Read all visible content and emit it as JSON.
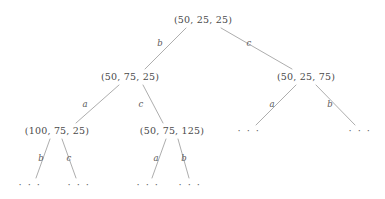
{
  "figure": {
    "kind": "derivation-tree",
    "stroke_color": "#8a8a8a",
    "text_color": "#4a4a4a",
    "background_color": "#ffffff",
    "ellipsis": "· · ·"
  },
  "nodes": {
    "root": {
      "label": "(50, 25, 25)",
      "x": 203,
      "y": 20
    },
    "left": {
      "label": "(50, 75, 25)",
      "x": 130,
      "y": 77
    },
    "right": {
      "label": "(50, 25, 75)",
      "x": 306,
      "y": 77
    },
    "left_left": {
      "label": "(100, 75, 25)",
      "x": 57,
      "y": 131
    },
    "left_right": {
      "label": "(50, 75, 125)",
      "x": 172,
      "y": 131
    },
    "right_left": {
      "label": "· · ·",
      "x": 249,
      "y": 131
    },
    "right_right": {
      "label": "· · ·",
      "x": 360,
      "y": 131
    },
    "ll_left": {
      "label": "· · ·",
      "x": 30,
      "y": 185
    },
    "ll_right": {
      "label": "· · ·",
      "x": 79,
      "y": 185
    },
    "lr_left": {
      "label": "· · ·",
      "x": 148,
      "y": 185
    },
    "lr_right": {
      "label": "· · ·",
      "x": 190,
      "y": 185
    }
  },
  "edges": [
    {
      "name": "root-to-left",
      "label": "b",
      "x1": 186,
      "y1": 28,
      "x2": 145,
      "y2": 69,
      "lx": 160,
      "ly": 43
    },
    {
      "name": "root-to-right",
      "label": "c",
      "x1": 221,
      "y1": 28,
      "x2": 292,
      "y2": 69,
      "lx": 249,
      "ly": 43
    },
    {
      "name": "left-to-left-left",
      "label": "a",
      "x1": 119,
      "y1": 85,
      "x2": 76,
      "y2": 123,
      "lx": 85,
      "ly": 104
    },
    {
      "name": "left-to-left-right",
      "label": "c",
      "x1": 143,
      "y1": 85,
      "x2": 163,
      "y2": 123,
      "lx": 141,
      "ly": 104
    },
    {
      "name": "right-to-right-left",
      "label": "a",
      "x1": 296,
      "y1": 85,
      "x2": 256,
      "y2": 125,
      "lx": 272,
      "ly": 104
    },
    {
      "name": "right-to-right-right",
      "label": "b",
      "x1": 316,
      "y1": 85,
      "x2": 355,
      "y2": 125,
      "lx": 330,
      "ly": 104
    },
    {
      "name": "ll-to-ll-left",
      "label": "b",
      "x1": 50,
      "y1": 139,
      "x2": 36,
      "y2": 178,
      "lx": 41,
      "ly": 158
    },
    {
      "name": "ll-to-ll-right",
      "label": "c",
      "x1": 62,
      "y1": 139,
      "x2": 76,
      "y2": 178,
      "lx": 69,
      "ly": 158
    },
    {
      "name": "lr-to-lr-left",
      "label": "a",
      "x1": 166,
      "y1": 139,
      "x2": 152,
      "y2": 178,
      "lx": 156,
      "ly": 158
    },
    {
      "name": "lr-to-lr-right",
      "label": "b",
      "x1": 178,
      "y1": 139,
      "x2": 189,
      "y2": 178,
      "lx": 184,
      "ly": 158
    }
  ]
}
